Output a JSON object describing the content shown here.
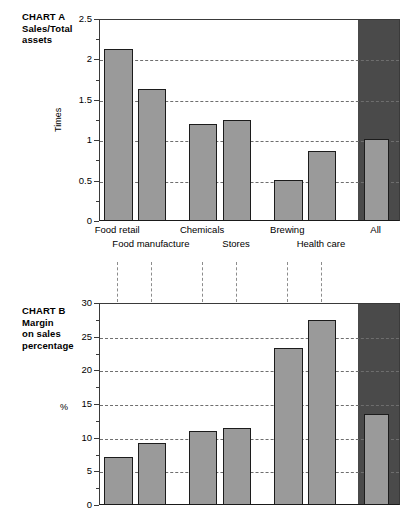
{
  "figure": {
    "width": 417,
    "height": 526,
    "background": "#ffffff",
    "bar_color": "#9a9a9a",
    "bar_border_color": "#1c1c1c",
    "all_panel_color": "#4a4a4a",
    "grid_color": "#6e6e6e",
    "axis_color": "#3a3a3a"
  },
  "chart_a": {
    "title": "CHART A\nSales/Total\nassets",
    "ylabel": "Times",
    "yticks": [
      "0",
      "0.5",
      "1",
      "1.5",
      "2",
      "2.5"
    ],
    "xlabels_row1": [
      "Food retail",
      "Chemicals",
      "Brewing",
      "All"
    ],
    "xlabels_row2": [
      "Food manufacture",
      "Stores",
      "Health care"
    ]
  },
  "chart_b": {
    "title": "CHART B\nMargin\non sales\npercentage",
    "ylabel": "%",
    "yticks": [
      "0",
      "5",
      "10",
      "15",
      "20",
      "25",
      "30"
    ]
  },
  "chart_data": [
    {
      "type": "bar",
      "id": "chart-a",
      "title": "CHART A Sales/Total assets",
      "xlabel": "",
      "ylabel": "Times",
      "ylim": [
        0,
        2.5
      ],
      "ytick_values": [
        0,
        0.5,
        1,
        1.5,
        2,
        2.5
      ],
      "minor_tick_step": 0.25,
      "grid": "horizontal-dashed",
      "legend": "none",
      "categories": [
        "Food retail",
        "Food manufacture",
        "Chemicals",
        "Stores",
        "Brewing",
        "Health care",
        "All"
      ],
      "values": [
        2.14,
        1.65,
        1.21,
        1.26,
        0.52,
        0.88,
        1.03
      ],
      "highlight_category": "All"
    },
    {
      "type": "bar",
      "id": "chart-b",
      "title": "CHART B Margin on sales percentage",
      "xlabel": "",
      "ylabel": "%",
      "ylim": [
        0,
        30
      ],
      "ytick_values": [
        0,
        5,
        10,
        15,
        20,
        25,
        30
      ],
      "minor_tick_step": 2.5,
      "grid": "horizontal-dashed",
      "legend": "none",
      "categories": [
        "Food retail",
        "Food manufacture",
        "Chemicals",
        "Stores",
        "Brewing",
        "Health care",
        "All"
      ],
      "values": [
        7.3,
        9.3,
        11.1,
        11.6,
        23.5,
        27.6,
        13.7
      ],
      "highlight_category": "All"
    }
  ]
}
